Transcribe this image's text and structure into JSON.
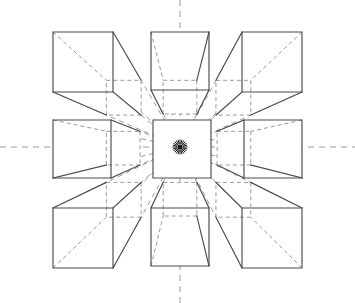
{
  "diagram": {
    "canvas": {
      "width": 355,
      "height": 303,
      "background": "#ffffff"
    },
    "style": {
      "solid_edge_color": "#4a4a52",
      "hidden_edge_color": "#9a9aa2",
      "axis_color": "#9a9aa2",
      "vanishing_point_color": "#1a1a1a",
      "face_fill": "#ffffff",
      "solid_edge_width": 1.15,
      "hidden_edge_width": 1,
      "hidden_edge_dash": "4 3",
      "ray_dash": "5 4",
      "axis_dash": "6 5"
    },
    "vanishing_point": {
      "x": 180,
      "y": 147,
      "label": "VP",
      "dot_radius": 2.6
    },
    "axes": [
      {
        "name": "horizon-line",
        "orientation": "horizontal",
        "x1": 0,
        "y1": 147,
        "x2": 355,
        "y2": 147
      },
      {
        "name": "vertical-axis",
        "orientation": "vertical",
        "x1": 180,
        "y1": 0,
        "x2": 180,
        "y2": 303
      }
    ],
    "grid": {
      "rows": 3,
      "columns": 3,
      "cube_count": 9,
      "face_size": 60,
      "depth_ratio": 0.42,
      "cell_origins_x": [
        53,
        153,
        253
      ],
      "cell_origins_y": [
        32,
        120,
        208
      ]
    },
    "cubes": [
      {
        "id": "cube-top-left",
        "row": 0,
        "col": 0,
        "x": 53,
        "y": 32,
        "size": 60,
        "position": "top-left",
        "recede_dir": "down-right"
      },
      {
        "id": "cube-top-center",
        "row": 0,
        "col": 1,
        "x": 151,
        "y": 32,
        "size": 58,
        "position": "top-center",
        "recede_dir": "down"
      },
      {
        "id": "cube-top-right",
        "row": 0,
        "col": 2,
        "x": 242,
        "y": 32,
        "size": 60,
        "position": "top-right",
        "recede_dir": "down-left"
      },
      {
        "id": "cube-middle-left",
        "row": 1,
        "col": 0,
        "x": 53,
        "y": 120,
        "size": 58,
        "position": "middle-left",
        "recede_dir": "right"
      },
      {
        "id": "cube-middle-center",
        "row": 1,
        "col": 1,
        "x": 153,
        "y": 120,
        "size": 58,
        "position": "middle-center",
        "recede_dir": "none"
      },
      {
        "id": "cube-middle-right",
        "row": 1,
        "col": 2,
        "x": 244,
        "y": 120,
        "size": 58,
        "position": "middle-right",
        "recede_dir": "left"
      },
      {
        "id": "cube-bottom-left",
        "row": 2,
        "col": 0,
        "x": 53,
        "y": 208,
        "size": 60,
        "position": "bottom-left",
        "recede_dir": "up-right"
      },
      {
        "id": "cube-bottom-center",
        "row": 2,
        "col": 1,
        "x": 151,
        "y": 208,
        "size": 58,
        "position": "bottom-center",
        "recede_dir": "up"
      },
      {
        "id": "cube-bottom-right",
        "row": 2,
        "col": 2,
        "x": 242,
        "y": 208,
        "size": 60,
        "position": "bottom-right",
        "recede_dir": "up-left"
      }
    ],
    "labels": []
  }
}
